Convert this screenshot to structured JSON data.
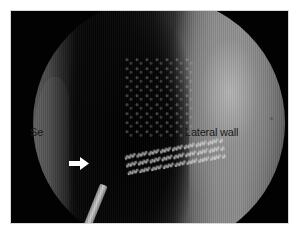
{
  "image": {
    "description": "Endoscopic view of nasal cavity within black frame",
    "labels": {
      "septum": "Se",
      "lateral_wall": "Lateral wall"
    },
    "annotation": {
      "arrow_icon": "white-right-arrow",
      "arrow_color": "#ffffff"
    },
    "colors": {
      "frame": "#020202",
      "background": "#ffffff",
      "label_text": "#1a1a1a"
    }
  }
}
